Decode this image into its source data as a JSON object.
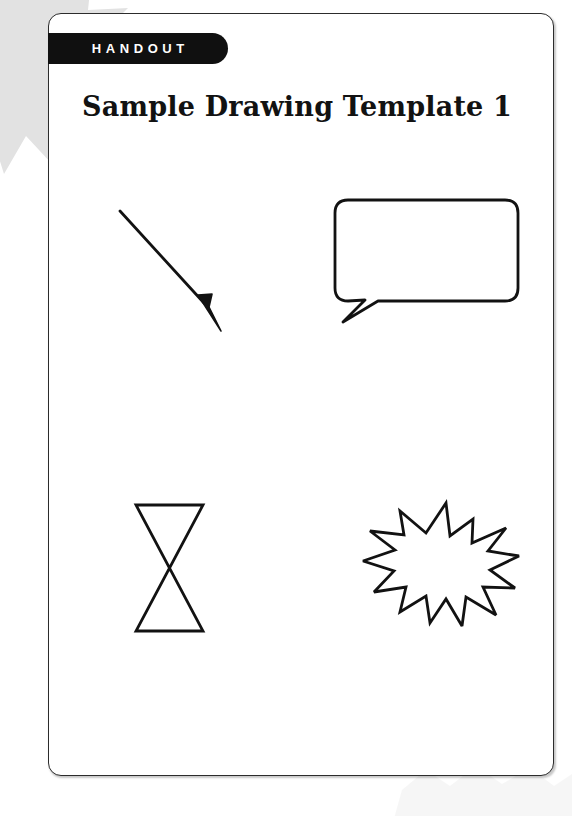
{
  "document": {
    "kind": "handout",
    "badge_label": "HANDOUT",
    "title": "Sample Drawing Template 1",
    "page_background": "#ffffff",
    "card_border_color": "#2c2c2c",
    "badge_background": "#101010",
    "badge_text_color": "#ffffff",
    "ink_color": "#121212",
    "decoration_color": "#e2e2e2"
  },
  "shapes": [
    {
      "id": "arrow",
      "name": "diagonal-arrow",
      "label": "Diagonal arrow pointing down-right",
      "stroke": "#121212",
      "fill": "none",
      "stroke_width": 2.6,
      "position": "top-left"
    },
    {
      "id": "bubble",
      "name": "speech-bubble",
      "label": "Rounded speech bubble with tail",
      "stroke": "#121212",
      "fill": "#ffffff",
      "stroke_width": 2.6,
      "position": "top-right"
    },
    {
      "id": "hourglass",
      "name": "hourglass",
      "label": "Hourglass / bowtie of two triangles",
      "stroke": "#121212",
      "fill": "none",
      "stroke_width": 2.6,
      "position": "bottom-left"
    },
    {
      "id": "starburst",
      "name": "starburst",
      "label": "Jagged starburst explosion",
      "stroke": "#121212",
      "fill": "#ffffff",
      "stroke_width": 2.6,
      "position": "bottom-right"
    }
  ],
  "decorations": [
    {
      "id": "splat-topleft",
      "name": "corner-splat-top-left",
      "color": "#e2e2e2"
    },
    {
      "id": "splat-bottomright",
      "name": "corner-splat-bottom-right",
      "color": "#efefef"
    }
  ]
}
